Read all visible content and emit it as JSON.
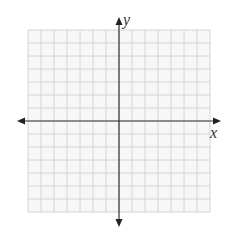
{
  "diagram": {
    "type": "coordinate-plane",
    "grid": {
      "columns": 14,
      "rows": 14,
      "left": 28,
      "top": 30,
      "cell": 13,
      "line_color": "#d4d4d4",
      "background": "#f7f7f7"
    },
    "axes": {
      "x_label": "x",
      "y_label": "y",
      "color": "#333333",
      "origin_col": 7,
      "origin_row": 7,
      "x_extent": [
        18,
        220
      ],
      "y_extent": [
        18,
        226
      ]
    }
  }
}
